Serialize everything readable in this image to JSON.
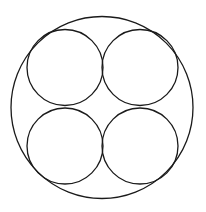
{
  "diagram": {
    "stroke_color": "#1a1a1a",
    "background": "#ffffff",
    "outer_circle": {
      "cx": 102,
      "cy": 107.5,
      "r": 91
    },
    "inner_circles": [
      {
        "name": "top-left",
        "cx": 65,
        "cy": 67.5,
        "r": 38
      },
      {
        "name": "top-right",
        "cx": 140,
        "cy": 67.5,
        "r": 38
      },
      {
        "name": "bottom-left",
        "cx": 65,
        "cy": 146,
        "r": 38
      },
      {
        "name": "bottom-right",
        "cx": 140,
        "cy": 146,
        "r": 38
      }
    ]
  }
}
